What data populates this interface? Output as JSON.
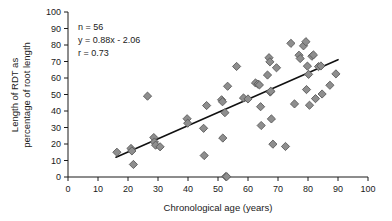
{
  "chart_data": {
    "type": "scatter",
    "title": "",
    "xlabel": "Chronological age (years)",
    "ylabel_line1": "Length of RDT as",
    "ylabel_line2": "percentage of root length",
    "xlim": [
      0,
      100
    ],
    "ylim": [
      0,
      100
    ],
    "xticks": [
      0,
      10,
      20,
      30,
      40,
      50,
      60,
      70,
      80,
      90,
      100
    ],
    "yticks": [
      0,
      10,
      20,
      30,
      40,
      50,
      60,
      70,
      80,
      90,
      100
    ],
    "xtick_labels": [
      "0",
      "10",
      "20",
      "30",
      "40",
      "50",
      "60",
      "70",
      "80",
      "90",
      "100"
    ],
    "ytick_labels": [
      "0",
      "10",
      "20",
      "30",
      "40",
      "50",
      "60",
      "70",
      "80",
      "90",
      "100"
    ],
    "grid": false,
    "legend": "none",
    "marker_shape": "diamond",
    "marker_color": "#8e8e8e",
    "marker_edge_color": "#5a5a5a",
    "annotations": {
      "n_label": "n = 56",
      "equation_label": "y = 0.88x - 2.06",
      "correlation_label": "r = 0.73"
    },
    "fit_line": {
      "slope": 0.88,
      "intercept": -2.06,
      "x_start": 16,
      "x_end": 90,
      "y_start": 12.0,
      "y_end": 71.1,
      "color": "#111111"
    },
    "n_points": 56,
    "points": [
      [
        16.3,
        15.0
      ],
      [
        21.0,
        17.3
      ],
      [
        21.3,
        15.8
      ],
      [
        21.8,
        7.6
      ],
      [
        26.5,
        49.0
      ],
      [
        28.6,
        23.9
      ],
      [
        28.8,
        21.2
      ],
      [
        29.2,
        19.3
      ],
      [
        30.7,
        18.3
      ],
      [
        39.7,
        35.3
      ],
      [
        39.9,
        32.6
      ],
      [
        45.2,
        29.5
      ],
      [
        45.4,
        13.0
      ],
      [
        46.2,
        43.3
      ],
      [
        51.2,
        46.8
      ],
      [
        51.5,
        45.6
      ],
      [
        51.6,
        23.6
      ],
      [
        52.3,
        39.0
      ],
      [
        52.6,
        0.3
      ],
      [
        52.9,
        0.2
      ],
      [
        53.2,
        55.0
      ],
      [
        56.2,
        67.0
      ],
      [
        58.5,
        47.9
      ],
      [
        60.0,
        47.3
      ],
      [
        62.5,
        57.0
      ],
      [
        63.3,
        56.3
      ],
      [
        63.8,
        55.8
      ],
      [
        64.2,
        42.6
      ],
      [
        64.4,
        31.2
      ],
      [
        66.5,
        61.8
      ],
      [
        67.0,
        72.3
      ],
      [
        67.3,
        69.8
      ],
      [
        67.4,
        51.5
      ],
      [
        67.6,
        52.0
      ],
      [
        67.8,
        35.2
      ],
      [
        68.3,
        19.9
      ],
      [
        69.5,
        66.2
      ],
      [
        72.5,
        18.5
      ],
      [
        74.3,
        81.0
      ],
      [
        75.5,
        44.3
      ],
      [
        77.0,
        73.8
      ],
      [
        77.4,
        71.8
      ],
      [
        78.5,
        79.5
      ],
      [
        79.3,
        82.0
      ],
      [
        79.5,
        53.0
      ],
      [
        79.8,
        67.2
      ],
      [
        80.2,
        62.2
      ],
      [
        80.5,
        43.5
      ],
      [
        81.3,
        73.2
      ],
      [
        81.8,
        74.0
      ],
      [
        82.5,
        47.5
      ],
      [
        83.5,
        66.9
      ],
      [
        84.3,
        67.3
      ],
      [
        84.7,
        50.3
      ],
      [
        87.3,
        55.6
      ],
      [
        89.3,
        62.5
      ]
    ]
  }
}
